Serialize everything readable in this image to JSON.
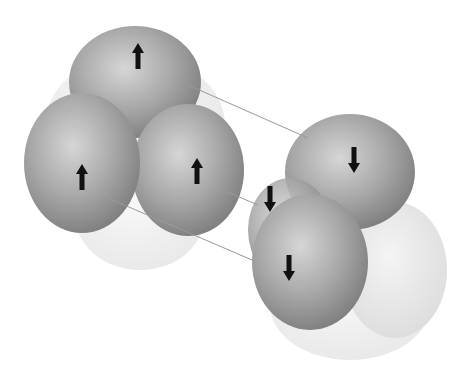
{
  "diagram": {
    "colors": {
      "background": "#ffffff",
      "nucleon_dark": "#8f8f8f",
      "nucleon_light": "#e6e6e6",
      "ghost": "#eeeeee",
      "arrow": "#111111",
      "connector": "#9a9a9a"
    },
    "left_cluster": {
      "spheres": [
        {
          "id": "top",
          "spin": "up"
        },
        {
          "id": "left",
          "spin": "up"
        },
        {
          "id": "right",
          "spin": "up"
        }
      ]
    },
    "right_cluster": {
      "spheres": [
        {
          "id": "top",
          "spin": "down"
        },
        {
          "id": "middle",
          "spin": "down"
        },
        {
          "id": "front",
          "spin": "down"
        }
      ]
    }
  }
}
